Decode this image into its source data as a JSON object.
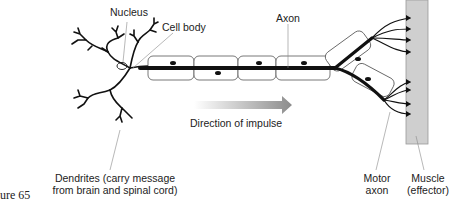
{
  "figure": {
    "caption": "ure 65"
  },
  "labels": {
    "nucleus": "Nucleus",
    "cell_body": "Cell body",
    "axon": "Axon",
    "direction": "Direction of impulse",
    "dendrites_line1": "Dendrites (carry message",
    "dendrites_line2": "from brain and spinal cord)",
    "motor_axon_line1": "Motor",
    "motor_axon_line2": "axon",
    "muscle_line1": "Muscle",
    "muscle_line2": "(effector)"
  },
  "colors": {
    "line": "#111111",
    "muscle_fill": "#cfcfcf",
    "arrow_start": "#ffffff",
    "arrow_end": "#8c8c8c",
    "leader": "#888888"
  }
}
